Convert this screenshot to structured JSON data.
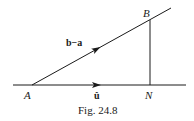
{
  "diagram": {
    "points": {
      "A": {
        "label": "A",
        "x": 32,
        "y": 85
      },
      "B": {
        "label": "B",
        "x": 150,
        "y": 20
      },
      "N": {
        "label": "N",
        "x": 150,
        "y": 85
      }
    },
    "vectors": {
      "diagonal": {
        "label": "b−a"
      },
      "horizontal": {
        "label": "û"
      }
    },
    "caption": "Fig. 24.8",
    "colors": {
      "ink": "#1a1a1a",
      "background": "#ffffff"
    }
  }
}
